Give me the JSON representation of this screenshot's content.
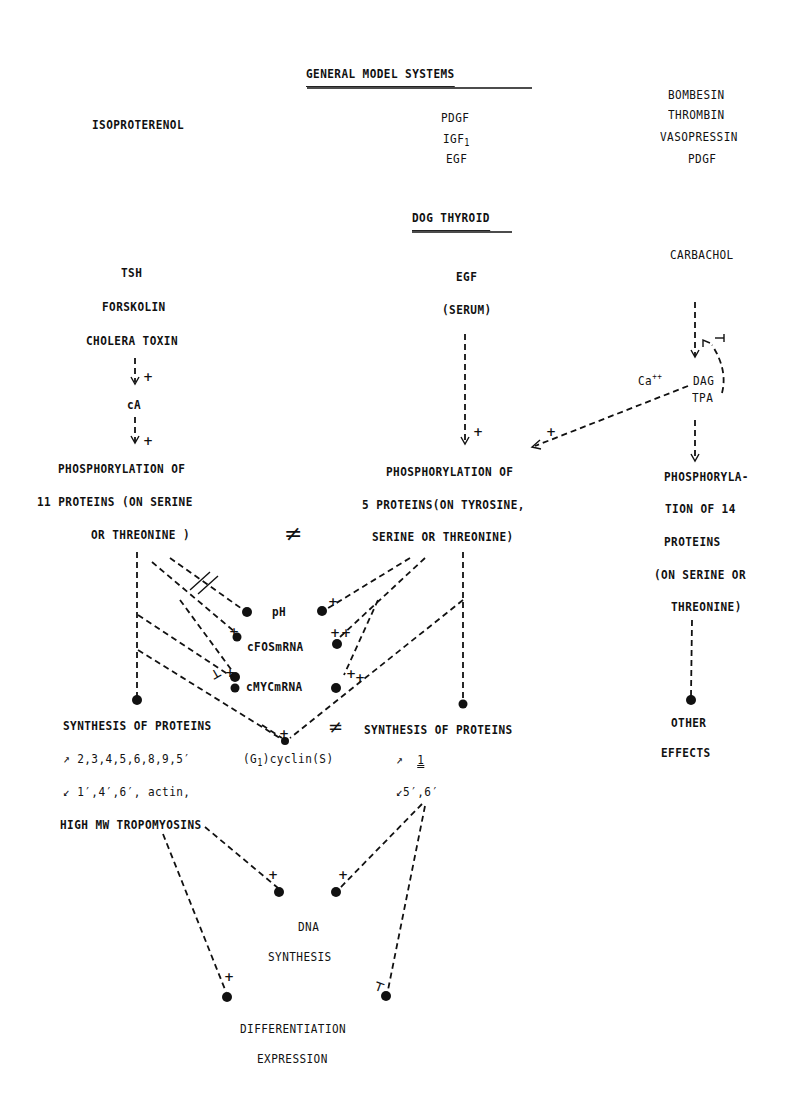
{
  "header": {
    "general_title": "GENERAL  MODEL  SYSTEMS",
    "dog_title": "DOG THYROID"
  },
  "general_model": {
    "left": "ISOPROTERENOL",
    "center": [
      "PDGF",
      "IGF",
      "1",
      "EGF"
    ],
    "right": [
      "BOMBESIN",
      "THROMBIN",
      "VASOPRESSIN",
      "PDGF"
    ]
  },
  "left_pathway": {
    "agonists": [
      "TSH",
      "FORSKOLIN",
      "CHOLERA TOXIN"
    ],
    "mediator": "cA",
    "phosphorylation": [
      "PHOSPHORYLATION OF",
      "11 PROTEINS (ON SERINE",
      "OR THREONINE )"
    ],
    "synthesis_title": "SYNTHESIS OF PROTEINS",
    "synthesis_up": "2,3,4,5,6,8,9,5′",
    "synthesis_down": "1′,4′,6′, actin,",
    "synthesis_extra": "HIGH MW TROPOMYOSINS"
  },
  "center_pathway": {
    "agonists": [
      "EGF",
      "(SERUM)"
    ],
    "phosphorylation": [
      "PHOSPHORYLATION OF",
      "5 PROTEINS(ON TYROSINE,",
      "SERINE OR THREONINE)"
    ],
    "synthesis_title": "SYNTHESIS OF PROTEINS",
    "synthesis_up": "1",
    "synthesis_down": "5′,6′"
  },
  "right_pathway": {
    "agonist": "CARBACHOL",
    "ca": "Ca",
    "ca_sup": "++",
    "dag": "DAG",
    "tpa": "TPA",
    "phosphorylation": [
      "PHOSPHORYLA-",
      "TION OF 14",
      "PROTEINS",
      "(ON SERINE OR",
      "THREONINE)"
    ],
    "effects": [
      "OTHER",
      "EFFECTS"
    ]
  },
  "intermediates": {
    "ph": "pH",
    "cfos": "cFOSmRNA",
    "cmyc": "cMYCmRNA",
    "cyclin_pre": "(G",
    "cyclin_sub": "1",
    "cyclin_post": ")cyclin(S)"
  },
  "outputs": {
    "dna": [
      "DNA",
      "SYNTHESIS"
    ],
    "differentiation": [
      "DIFFERENTIATION",
      "EXPRESSION"
    ]
  },
  "symbols": {
    "not_equal": "≠",
    "plus": "+",
    "inhibit": "⊣",
    "up_arrow": "↗",
    "down_arrow": "↙"
  }
}
